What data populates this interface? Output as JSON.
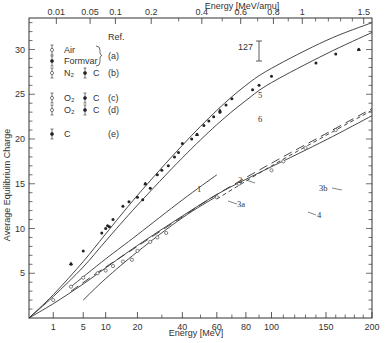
{
  "chart_data": {
    "type": "line",
    "title": "",
    "xlabel": "Energy [MeV]",
    "x2label": "Energy [MeV/amu]",
    "ylabel": "Average Equilibrium Charge",
    "x_scale": "sqrt",
    "xlim": [
      0,
      200
    ],
    "ylim": [
      0,
      34
    ],
    "grid": false,
    "x_ticks": [
      1,
      5,
      10,
      20,
      40,
      60,
      80,
      100,
      150,
      200
    ],
    "x_tick_labels": [
      "1",
      "5",
      "10",
      "20",
      "40",
      "60",
      "80",
      "100",
      "150",
      "200"
    ],
    "x2_ticks": [
      0.01,
      0.05,
      0.1,
      0.2,
      0.4,
      0.6,
      0.8,
      1,
      1.5
    ],
    "x2_tick_labels": [
      "0.01",
      "0.05",
      "0.1",
      "0.2",
      "0.4",
      "0.6",
      "0.8",
      "1",
      "1.5"
    ],
    "y_ticks": [
      5,
      10,
      15,
      20,
      25,
      30
    ],
    "y_tick_labels": [
      "5",
      "10",
      "15",
      "20",
      "25",
      "30"
    ],
    "annotation": {
      "text": "127",
      "error_bar": true
    },
    "legend": {
      "header": "Ref.",
      "entries": [
        {
          "symbol": "open-errorbar",
          "label": "Air",
          "ref": "(a)"
        },
        {
          "symbol": "filled-errorbar",
          "label": "Formvar",
          "ref": "(a)"
        },
        {
          "symbol": "open-errorbar",
          "label": "N₂",
          "symbol2": "filled-errorbar",
          "label2": "C",
          "ref": "(b)"
        },
        {
          "symbol": "open-errorbar",
          "label": "O₂",
          "symbol2": "filled-errorbar",
          "label2": "C",
          "ref": "(c)"
        },
        {
          "symbol": "open-errorbar",
          "label": "O₂",
          "symbol2": "filled-errorbar",
          "label2": "C",
          "ref": "(d)"
        },
        {
          "symbol": "filled-errorbar",
          "label": "C",
          "ref": "(e)"
        }
      ]
    },
    "series": [
      {
        "name": "5",
        "style": "solid",
        "x": [
          0,
          1,
          5,
          10,
          20,
          40,
          60,
          80,
          100,
          150,
          200
        ],
        "y": [
          0,
          2.6,
          6.3,
          9.4,
          13.7,
          19.3,
          23.2,
          26.0,
          27.9,
          31.0,
          33.0
        ]
      },
      {
        "name": "6",
        "style": "solid",
        "x": [
          0,
          1,
          5,
          10,
          20,
          40,
          60,
          80,
          100,
          150,
          200
        ],
        "y": [
          0,
          2.4,
          5.7,
          8.6,
          12.6,
          17.9,
          21.6,
          24.3,
          26.3,
          29.5,
          31.9
        ]
      },
      {
        "name": "1",
        "style": "solid",
        "x": [
          3,
          10,
          20,
          40,
          60
        ],
        "y": [
          3.5,
          6.6,
          9.3,
          13.2,
          16.0
        ]
      },
      {
        "name": "2",
        "style": "dashed",
        "x": [
          3,
          10,
          20,
          40,
          60,
          100,
          150,
          200
        ],
        "y": [
          3.0,
          5.7,
          8.0,
          11.3,
          13.8,
          17.3,
          20.6,
          23.4
        ]
      },
      {
        "name": "3b",
        "style": "short-dash",
        "x": [
          60,
          100,
          150,
          200
        ],
        "y": [
          13.3,
          17.0,
          20.4,
          23.2
        ]
      },
      {
        "name": "3a",
        "style": "solid",
        "x": [
          5,
          10,
          20,
          40,
          60
        ],
        "y": [
          2.0,
          4.4,
          7.4,
          11.2,
          13.6
        ]
      },
      {
        "name": "4",
        "style": "solid",
        "x": [
          0,
          1,
          5,
          10,
          20,
          40,
          60,
          80,
          100,
          150,
          200
        ],
        "y": [
          0,
          1.6,
          3.8,
          5.6,
          8.1,
          11.4,
          13.8,
          15.5,
          16.9,
          19.9,
          22.6
        ]
      }
    ],
    "points_filled": {
      "x": [
        3,
        5,
        9,
        10,
        10.5,
        11,
        12,
        15,
        17,
        20,
        22,
        23,
        25,
        28,
        30,
        33,
        36,
        38,
        40,
        45,
        48,
        52,
        55,
        58,
        62,
        66,
        70,
        85,
        90,
        100,
        140,
        160,
        185
      ],
      "y": [
        6.0,
        7.5,
        9.5,
        10.0,
        10.3,
        10.2,
        11.0,
        12.5,
        13.0,
        13.5,
        13.2,
        15.0,
        14.5,
        16.0,
        16.5,
        17.0,
        18.0,
        18.5,
        19.5,
        20.0,
        20.5,
        21.5,
        22.0,
        22.5,
        23.0,
        23.8,
        24.5,
        25.5,
        26.0,
        27.0,
        28.5,
        29.5,
        30.0
      ]
    },
    "points_open": {
      "x": [
        1,
        3,
        5,
        8,
        10,
        12,
        15,
        18,
        20,
        25,
        28,
        32,
        60,
        75,
        100,
        110,
        130,
        160
      ],
      "y": [
        2.0,
        3.5,
        4.5,
        5.0,
        5.3,
        5.8,
        6.3,
        6.5,
        7.5,
        8.5,
        9.0,
        9.5,
        13.5,
        15.0,
        16.5,
        17.5,
        19.0,
        21.0
      ]
    }
  }
}
